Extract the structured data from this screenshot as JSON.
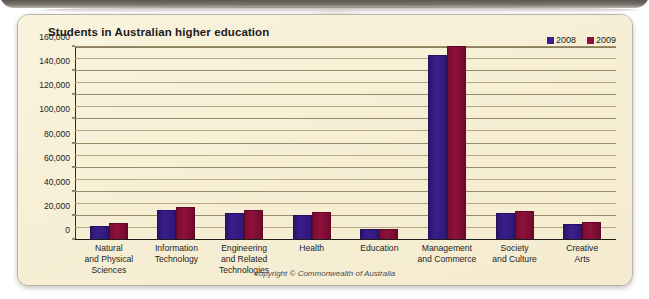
{
  "panel": {
    "background_color": "#f8f0d8",
    "border_color": "#b9b3a4"
  },
  "chart_data": {
    "type": "bar",
    "title": "Students in Australian higher education",
    "xlabel": "",
    "ylabel": "",
    "ylim": [
      0,
      160000
    ],
    "yticks": [
      "0",
      "20,000",
      "40,000",
      "60,000",
      "80,000",
      "100,000",
      "120,000",
      "140,000",
      "160,000"
    ],
    "ytick_values": [
      0,
      20000,
      40000,
      60000,
      80000,
      100000,
      120000,
      140000,
      160000
    ],
    "minor_tick_step": 10000,
    "grid": true,
    "legend_position": "top-right",
    "categories": [
      "Natural and Physical Sciences",
      "Information Technology",
      "Engineering and Related Technologies",
      "Health",
      "Education",
      "Management and Commerce",
      "Society and Culture",
      "Creative Arts"
    ],
    "category_lines": [
      [
        "Natural",
        "and Physical",
        "Sciences"
      ],
      [
        "Information",
        "Technology"
      ],
      [
        "Engineering",
        "and Related",
        "Technologies"
      ],
      [
        "Health"
      ],
      [
        "Education"
      ],
      [
        "Management",
        "and Commerce"
      ],
      [
        "Society",
        "and Culture"
      ],
      [
        "Creative",
        "Arts"
      ]
    ],
    "series": [
      {
        "name": "2008",
        "color": "#3a1f8c",
        "values": [
          12000,
          25000,
          22500,
          21000,
          9500,
          153000,
          22000,
          13000
        ]
      },
      {
        "name": "2009",
        "color": "#8e123c",
        "values": [
          14000,
          27000,
          25000,
          23000,
          9500,
          160500,
          24000,
          15000
        ]
      }
    ]
  },
  "legend": {
    "items": [
      {
        "label": "2008",
        "color": "#3a1f8c"
      },
      {
        "label": "2009",
        "color": "#8e123c"
      }
    ]
  },
  "footer": {
    "copyright": "copyright © Commonwealth of Australia"
  }
}
